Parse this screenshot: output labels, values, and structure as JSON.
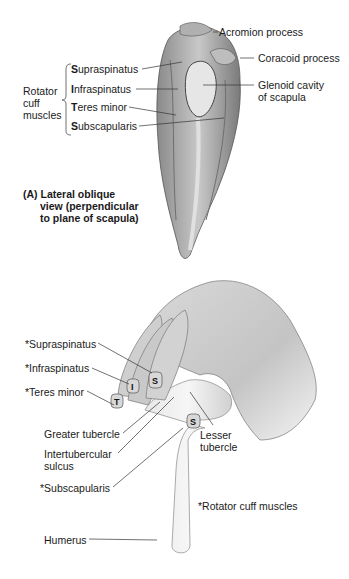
{
  "figure": {
    "panel_a": {
      "group_label": [
        "Rotator",
        "cuff",
        "muscles"
      ],
      "muscles": [
        {
          "initial": "S",
          "rest": "upraspinatus"
        },
        {
          "initial": "I",
          "rest": "nfraspinatus"
        },
        {
          "initial": "T",
          "rest": "eres minor"
        },
        {
          "initial": "S",
          "rest": "ubscapularis"
        }
      ],
      "right_labels": {
        "acromion": "Acromion process",
        "coracoid": "Coracoid process",
        "glenoid_1": "Glenoid cavity",
        "glenoid_2": "of scapula"
      },
      "caption": {
        "letter": "(A)",
        "line1": "Lateral oblique",
        "line2": "view (perpendicular",
        "line3": "to plane of scapula)"
      }
    },
    "panel_b": {
      "left_labels": {
        "supraspinatus": "*Supraspinatus",
        "infraspinatus": "*Infraspinatus",
        "teres_minor": "*Teres minor",
        "greater_tubercle": "Greater tubercle",
        "intertubercular_1": "Intertubercular",
        "intertubercular_2": "sulcus",
        "subscapularis": "*Subscapularis",
        "humerus": "Humerus"
      },
      "right_labels": {
        "lesser_1": "Lesser",
        "lesser_2": "tubercle",
        "note": "*Rotator cuff muscles"
      },
      "nail_letters": {
        "t": "T",
        "i": "I",
        "s": "S",
        "s2": "S"
      }
    }
  }
}
